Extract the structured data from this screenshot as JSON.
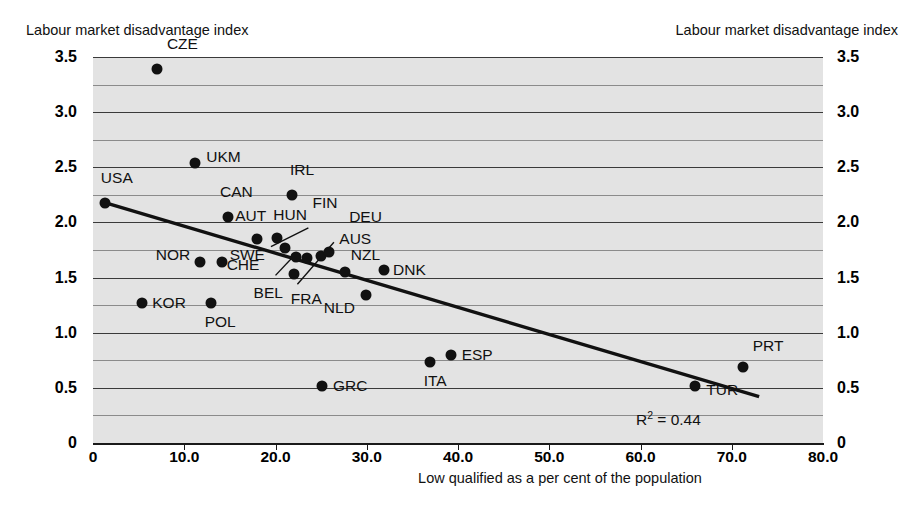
{
  "chart_data": {
    "type": "scatter",
    "title": "",
    "ylabel": "Labour market disadvantage index",
    "ylabel_right": "Labour market disadvantage index",
    "xlabel": "Low qualified as a per cent of the population",
    "xlim": [
      0,
      80
    ],
    "ylim": [
      0,
      3.5
    ],
    "xticks": [
      "0",
      "10.0",
      "20.0",
      "30.0",
      "40.0",
      "50.0",
      "60.0",
      "70.0",
      "80.0"
    ],
    "xtick_values": [
      0,
      10,
      20,
      30,
      40,
      50,
      60,
      70,
      80
    ],
    "yticks": [
      "0",
      "0.5",
      "1.0",
      "1.5",
      "2.0",
      "2.5",
      "3.0",
      "3.5"
    ],
    "ytick_values": [
      0,
      0.5,
      1.0,
      1.5,
      2.0,
      2.5,
      3.0,
      3.5
    ],
    "grid": true,
    "legend": "none",
    "annotation": "R2 = 0.44",
    "r_squared_label": "R",
    "r_squared_exp": "2",
    "r_squared_value": "= 0.44",
    "trendline": {
      "x0": 1.3,
      "y0": 2.18,
      "x1": 73.0,
      "y1": 0.42
    },
    "points": [
      {
        "label": "CZE",
        "x": 7.0,
        "y": 3.39,
        "lx": 10,
        "ly": -26
      },
      {
        "label": "UKM",
        "x": 11.2,
        "y": 2.54,
        "lx": 11,
        "ly": -7
      },
      {
        "label": "IRL",
        "x": 21.8,
        "y": 2.25,
        "lx": -2,
        "ly": -26
      },
      {
        "label": "USA",
        "x": 1.3,
        "y": 2.18,
        "lx": -4,
        "ly": -26
      },
      {
        "label": "CAN",
        "x": 14.8,
        "y": 2.05,
        "lx": -8,
        "ly": -26
      },
      {
        "label": "AUT",
        "x": 18.0,
        "y": 1.85,
        "lx": -22,
        "ly": -24
      },
      {
        "label": "HUN",
        "x": 20.2,
        "y": 1.86,
        "lx": -4,
        "ly": -24
      },
      {
        "label": "CHE",
        "x": 21.0,
        "y": 1.77,
        "lx": -58,
        "ly": 16
      },
      {
        "label": "NOR",
        "x": 11.7,
        "y": 1.64,
        "lx": -44,
        "ly": -8
      },
      {
        "label": "SWE",
        "x": 14.1,
        "y": 1.64,
        "lx": 8,
        "ly": -8
      },
      {
        "label": "BEL",
        "x": 22.2,
        "y": 1.69,
        "lx": -42,
        "ly": 35
      },
      {
        "label": "FRA",
        "x": 22.0,
        "y": 1.53,
        "lx": -3,
        "ly": 24
      },
      {
        "label": "DEU",
        "x": 25.0,
        "y": 1.7,
        "lx": 28,
        "ly": -40
      },
      {
        "label": "FIN",
        "x": 23.4,
        "y": 1.68,
        "lx": 6,
        "ly": -56
      },
      {
        "label": "AUS",
        "x": 25.9,
        "y": 1.73,
        "lx": 10,
        "ly": -14
      },
      {
        "label": "NZL",
        "x": 27.6,
        "y": 1.55,
        "lx": 6,
        "ly": -18
      },
      {
        "label": "DNK",
        "x": 31.9,
        "y": 1.57,
        "lx": 9,
        "ly": -1
      },
      {
        "label": "NLD",
        "x": 29.9,
        "y": 1.34,
        "lx": -42,
        "ly": 12
      },
      {
        "label": "KOR",
        "x": 5.4,
        "y": 1.27,
        "lx": 10,
        "ly": -1
      },
      {
        "label": "POL",
        "x": 12.9,
        "y": 1.27,
        "lx": -6,
        "ly": 18
      },
      {
        "label": "GRC",
        "x": 25.1,
        "y": 0.52,
        "lx": 11,
        "ly": -1
      },
      {
        "label": "ITA",
        "x": 36.9,
        "y": 0.73,
        "lx": -6,
        "ly": 18
      },
      {
        "label": "ESP",
        "x": 39.2,
        "y": 0.8,
        "lx": 11,
        "ly": -1
      },
      {
        "label": "TUR",
        "x": 66.0,
        "y": 0.52,
        "lx": 11,
        "ly": 3
      },
      {
        "label": "PRT",
        "x": 71.2,
        "y": 0.69,
        "lx": 10,
        "ly": -22
      }
    ],
    "leader_lines": [
      {
        "x0": 19.5,
        "y0": 1.78,
        "x1": 23.6,
        "y1": 1.95
      },
      {
        "x0": 20.0,
        "y0": 1.52,
        "x1": 22.4,
        "y1": 1.73
      },
      {
        "x0": 22.4,
        "y0": 1.44,
        "x1": 26.4,
        "y1": 1.82
      }
    ]
  }
}
